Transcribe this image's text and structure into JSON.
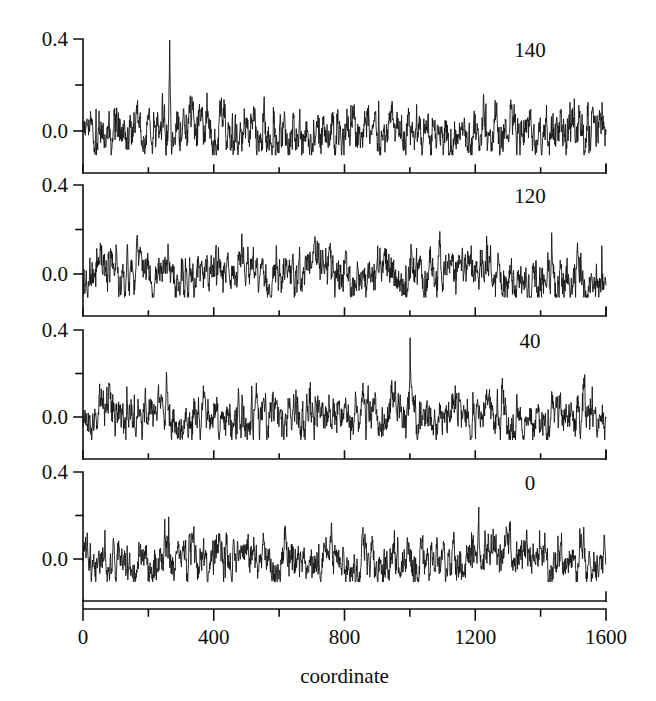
{
  "figure": {
    "title": "",
    "background_color": "#ffffff",
    "trace_color": "#151515",
    "axis_color": "#111111"
  },
  "axis": {
    "x_title": "coordinate",
    "x_ticks": [
      "0",
      "400",
      "800",
      "1200",
      "1600"
    ],
    "x_minor_ticks": [
      200,
      600,
      1000,
      1400
    ],
    "y_ticks": [
      "0.4",
      "0.0"
    ],
    "y_minor_ticks": [
      0.2
    ]
  },
  "panels": [
    {
      "label": "140",
      "ylim": [
        -0.11,
        0.45
      ],
      "xlim": [
        0,
        1600
      ]
    },
    {
      "label": "120",
      "ylim": [
        -0.11,
        0.45
      ],
      "xlim": [
        0,
        1600
      ]
    },
    {
      "label": "40",
      "ylim": [
        -0.11,
        0.45
      ],
      "xlim": [
        0,
        1600
      ]
    },
    {
      "label": "0",
      "ylim": [
        -0.11,
        0.45
      ],
      "xlim": [
        0,
        1600
      ]
    }
  ],
  "chart_data": {
    "type": "line",
    "title": "",
    "xlabel": "coordinate",
    "ylabel": "",
    "xlim": [
      0,
      1600
    ],
    "ylim": [
      -0.13,
      0.45
    ],
    "x_ticks": [
      0,
      400,
      800,
      1200,
      1600
    ],
    "x_minor_ticks": [
      200,
      600,
      1000,
      1400
    ],
    "y_ticks": [
      0.0,
      0.4
    ],
    "y_minor_ticks": [
      0.2
    ],
    "grid": false,
    "legend": "none",
    "panel_layout": "4 stacked panels, shared x axis",
    "series": [
      {
        "name": "140",
        "panel": 0,
        "noise_rms": 0.042,
        "baseline": 0.0,
        "n_points": 1600,
        "seed": 1407,
        "spikes": [
          {
            "x": 265,
            "height": 0.42,
            "width": 6
          }
        ],
        "annotation": "140"
      },
      {
        "name": "120",
        "panel": 1,
        "noise_rms": 0.04,
        "baseline": 0.0,
        "n_points": 1600,
        "seed": 1203,
        "spikes": [
          {
            "x": 260,
            "height": 0.145,
            "width": 5
          },
          {
            "x": 485,
            "height": 0.135,
            "width": 5
          },
          {
            "x": 1215,
            "height": 0.145,
            "width": 5
          }
        ],
        "annotation": "120"
      },
      {
        "name": "40",
        "panel": 2,
        "noise_rms": 0.041,
        "baseline": 0.0,
        "n_points": 1600,
        "seed": 4011,
        "spikes": [
          {
            "x": 255,
            "height": 0.235,
            "width": 6
          },
          {
            "x": 1000,
            "height": 0.255,
            "width": 6
          }
        ],
        "annotation": "40"
      },
      {
        "name": "0",
        "panel": 3,
        "noise_rms": 0.039,
        "baseline": 0.0,
        "n_points": 1600,
        "seed": 77,
        "spikes": [
          {
            "x": 250,
            "height": 0.175,
            "width": 5
          },
          {
            "x": 760,
            "height": 0.185,
            "width": 5
          },
          {
            "x": 1210,
            "height": 0.185,
            "width": 5
          }
        ],
        "annotation": "0"
      }
    ]
  }
}
